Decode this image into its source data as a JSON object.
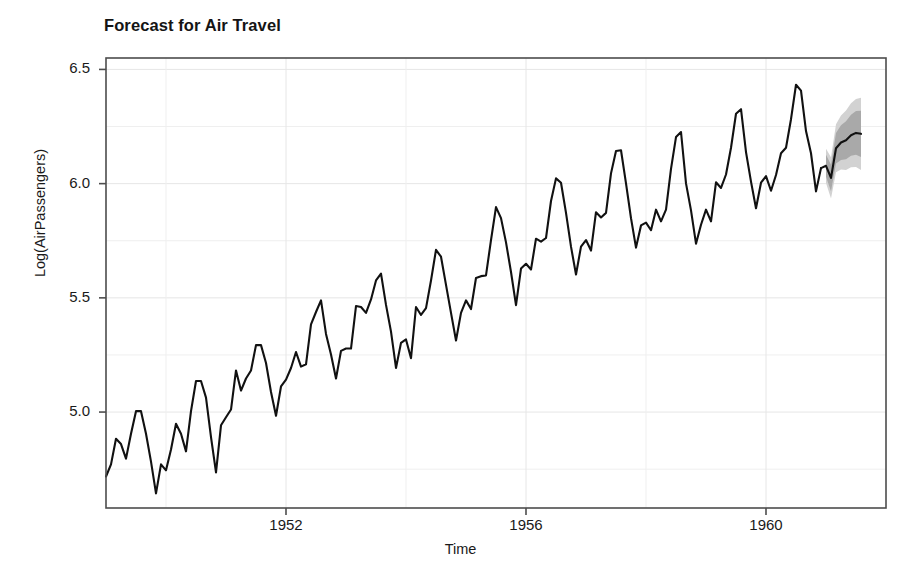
{
  "chart_data": {
    "type": "line",
    "title": "Forecast for Air Travel",
    "xlabel": "Time",
    "ylabel": "Log(AirPassengers)",
    "xlim": [
      1949.0,
      1962.0
    ],
    "ylim": [
      4.58,
      6.55
    ],
    "grid": true,
    "legend": null,
    "x_ticks": [
      1952,
      1956,
      1960
    ],
    "x_tick_labels": [
      "1952",
      "1956",
      "1960"
    ],
    "y_ticks": [
      5.0,
      5.5,
      6.0,
      6.5
    ],
    "y_tick_labels": [
      "5.0",
      "5.5",
      "6.0",
      "6.5"
    ],
    "series": [
      {
        "name": "Log(AirPassengers) observed",
        "color": "#111111",
        "line_width": 2.1,
        "x_start": 1949.0,
        "x_step": 0.08333333,
        "values": [
          4.718,
          4.771,
          4.883,
          4.86,
          4.796,
          4.905,
          5.004,
          5.004,
          4.905,
          4.783,
          4.644,
          4.771,
          4.745,
          4.836,
          4.949,
          4.905,
          4.828,
          5.004,
          5.136,
          5.136,
          5.063,
          4.89,
          4.736,
          4.942,
          4.977,
          5.011,
          5.182,
          5.094,
          5.147,
          5.182,
          5.293,
          5.293,
          5.215,
          5.088,
          4.984,
          5.112,
          5.142,
          5.193,
          5.263,
          5.199,
          5.209,
          5.384,
          5.438,
          5.489,
          5.342,
          5.252,
          5.147,
          5.268,
          5.278,
          5.278,
          5.464,
          5.46,
          5.434,
          5.493,
          5.576,
          5.606,
          5.469,
          5.352,
          5.193,
          5.303,
          5.318,
          5.236,
          5.46,
          5.425,
          5.455,
          5.576,
          5.71,
          5.68,
          5.557,
          5.434,
          5.313,
          5.434,
          5.489,
          5.451,
          5.587,
          5.595,
          5.598,
          5.753,
          5.897,
          5.849,
          5.743,
          5.613,
          5.468,
          5.628,
          5.649,
          5.624,
          5.759,
          5.746,
          5.762,
          5.924,
          6.023,
          6.004,
          5.872,
          5.724,
          5.602,
          5.724,
          5.753,
          5.707,
          5.875,
          5.852,
          5.872,
          6.045,
          6.143,
          6.146,
          6.001,
          5.849,
          5.72,
          5.817,
          5.829,
          5.796,
          5.886,
          5.835,
          5.886,
          6.065,
          6.204,
          6.226,
          6.001,
          5.883,
          5.737,
          5.82,
          5.886,
          5.835,
          6.006,
          5.981,
          6.04,
          6.157,
          6.306,
          6.326,
          6.138,
          6.009,
          5.892,
          6.004,
          6.033,
          5.969,
          6.038,
          6.133,
          6.157,
          6.282,
          6.433,
          6.407,
          6.23,
          6.133,
          5.966,
          6.068
        ]
      }
    ],
    "forecast": {
      "name": "Point forecast",
      "color": "#111111",
      "line_width": 2.1,
      "x_start": 1961.0,
      "x_step": 0.08333333,
      "mean": [
        6.078,
        6.025,
        6.155,
        6.18,
        6.19,
        6.212,
        6.222,
        6.218
      ],
      "lower_95": [
        6.003,
        5.935,
        6.05,
        6.062,
        6.06,
        6.072,
        6.073,
        6.06
      ],
      "upper_95": [
        6.153,
        6.115,
        6.26,
        6.298,
        6.32,
        6.352,
        6.371,
        6.376
      ],
      "lower_80": [
        6.03,
        5.967,
        6.088,
        6.104,
        6.107,
        6.122,
        6.126,
        6.117
      ],
      "upper_80": [
        6.126,
        6.083,
        6.222,
        6.256,
        6.273,
        6.302,
        6.318,
        6.319
      ],
      "band_95_color": "#d2d2d2",
      "band_80_color": "#a9a9a9",
      "interval_labels": [
        "80%",
        "95%"
      ]
    },
    "style": {
      "panel_background": "#ffffff",
      "panel_border_color": "#4d4d4d",
      "grid_color": "#efefef",
      "axis_text_color": "#1a1a1a",
      "figure_background": "#ffffff"
    },
    "panel": {
      "left": 106,
      "top": 58,
      "right": 886,
      "bottom": 508
    }
  }
}
